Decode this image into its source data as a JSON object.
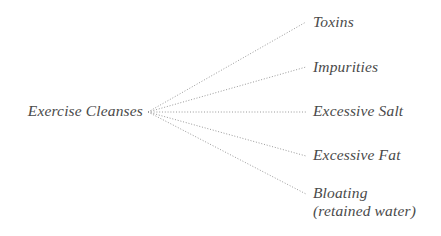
{
  "diagram": {
    "type": "fan-radial",
    "background_color": "#ffffff",
    "text_color": "#4a4a4a",
    "line_color": "#9a9a9a",
    "line_style": "dotted",
    "root": {
      "label": "Exercise Cleanses",
      "x": 143,
      "y": 112
    },
    "hub": {
      "x": 148,
      "y": 112
    },
    "branches": [
      {
        "label": "Toxins",
        "sublabel": "",
        "line_end_x": 306,
        "line_end_y": 22,
        "text_x": 313,
        "text_y": 23
      },
      {
        "label": "Impurities",
        "sublabel": "",
        "line_end_x": 306,
        "line_end_y": 67,
        "text_x": 313,
        "text_y": 68
      },
      {
        "label": "Excessive Salt",
        "sublabel": "",
        "line_end_x": 306,
        "line_end_y": 112,
        "text_x": 313,
        "text_y": 112
      },
      {
        "label": "Excessive Fat",
        "sublabel": "",
        "line_end_x": 306,
        "line_end_y": 156,
        "text_x": 313,
        "text_y": 156
      },
      {
        "label": "Bloating",
        "sublabel": "(retained water)",
        "line_end_x": 306,
        "line_end_y": 194,
        "text_x": 313,
        "text_y": 194
      }
    ]
  }
}
